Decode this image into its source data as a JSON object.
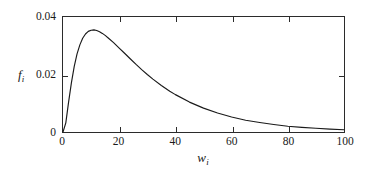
{
  "figure": {
    "background": "#ffffff",
    "line_color": "#1a1a1a",
    "axis_color": "#2b2b2b"
  },
  "axes": {
    "x_title": "w",
    "x_title_sub": "i",
    "y_title": "f",
    "y_title_sub": "i",
    "x_ticks": [
      "0",
      "20",
      "40",
      "60",
      "80",
      "100"
    ],
    "y_ticks": [
      "0",
      "0.02",
      "0.04"
    ]
  },
  "chart_data": {
    "type": "line",
    "title": "",
    "subtitle": "",
    "xlabel": "w_i",
    "ylabel": "f_i",
    "xlim": [
      0,
      100
    ],
    "ylim": [
      0,
      0.04
    ],
    "xticks": [
      0,
      20,
      40,
      60,
      80,
      100
    ],
    "yticks": [
      0,
      0.02,
      0.04
    ],
    "grid": false,
    "legend": null,
    "annotations": [],
    "series": [
      {
        "name": "f_i",
        "color": "#1a1a1a",
        "x": [
          0,
          1,
          2,
          3,
          4,
          5,
          6,
          7,
          8,
          9,
          10,
          11,
          12,
          13,
          14,
          15,
          16,
          18,
          20,
          22,
          24,
          26,
          28,
          30,
          32,
          35,
          38,
          40,
          45,
          50,
          55,
          60,
          65,
          70,
          75,
          80,
          85,
          90,
          95,
          100
        ],
        "y": [
          0.0,
          0.0032,
          0.0105,
          0.0172,
          0.0228,
          0.0272,
          0.0303,
          0.0326,
          0.0341,
          0.035,
          0.0354,
          0.0355,
          0.0353,
          0.0349,
          0.0343,
          0.0336,
          0.0328,
          0.0311,
          0.0292,
          0.0273,
          0.0254,
          0.0235,
          0.0217,
          0.02,
          0.0184,
          0.0162,
          0.0142,
          0.013,
          0.0104,
          0.0083,
          0.0066,
          0.0052,
          0.0041,
          0.0033,
          0.0026,
          0.002,
          0.0016,
          0.0013,
          0.001,
          0.0008
        ]
      }
    ]
  }
}
